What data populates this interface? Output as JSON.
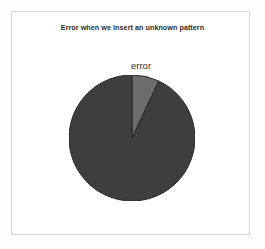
{
  "figure": {
    "title": "Error when we insert an unknown pattern",
    "background_color": "#ffffff",
    "frame_color": "#d8d8d8"
  },
  "chart_data": {
    "type": "pie",
    "title": "Error when we insert an unknown pattern",
    "xlabel": "",
    "ylabel": "",
    "categories": [
      "error",
      "no error"
    ],
    "values": [
      7,
      93
    ],
    "labels_shown": [
      "error"
    ],
    "start_angle_deg": 90,
    "direction": "clockwise",
    "colors": [
      "#6c6c6c",
      "#3e3e3e"
    ],
    "edge_color": "#2a2a2a",
    "legend": "none",
    "grid": false,
    "slices": [
      {
        "name": "error",
        "value": 7,
        "color": "#6c6c6c",
        "label": "error",
        "label_visible": true
      },
      {
        "name": "no error",
        "value": 93,
        "color": "#3e3e3e",
        "label": "",
        "label_visible": false
      }
    ]
  },
  "labels": {
    "error": "error"
  }
}
